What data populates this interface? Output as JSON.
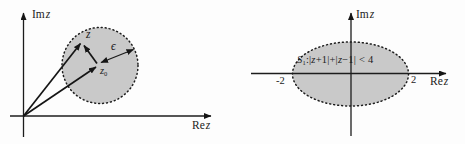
{
  "figure": {
    "left_diagram": {
      "im_axis_label": {
        "prefix": "Im",
        "variable": "z"
      },
      "re_axis_label": {
        "prefix": "Re",
        "variable": "z"
      },
      "point_z_label": "z",
      "point_z0_label": {
        "base": "z",
        "sub": "0"
      },
      "epsilon_label": "ϵ"
    },
    "right_diagram": {
      "im_axis_label": {
        "prefix": "Im",
        "variable": "z"
      },
      "re_axis_label": {
        "prefix": "Re",
        "variable": "z"
      },
      "region_label": {
        "set": "S",
        "set_sub": "1",
        "colon_open": ":|",
        "z1": "z",
        "mid1": "+1|+|",
        "z2": "z",
        "mid2": "−1| < 4"
      },
      "tick_left": "-2",
      "tick_right": "2"
    }
  },
  "colors": {
    "region_fill": "#c9c9c9",
    "line": "#1c1c1c",
    "background": "#fdfdfd"
  }
}
